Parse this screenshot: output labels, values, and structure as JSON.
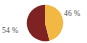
{
  "figure": {
    "background_color": "#ffffff",
    "label_color": "#4a4a4a"
  },
  "chart_data": {
    "type": "pie",
    "title": "",
    "subtitle": "",
    "xlabel": "",
    "ylabel": "",
    "grid": false,
    "legend_position": "none",
    "start_angle_deg": 0,
    "direction": "clockwise",
    "categories": [
      "46 %",
      "54 %"
    ],
    "values": [
      46,
      54
    ],
    "units": "percent",
    "total": 100,
    "slices": [
      {
        "label": "46 %",
        "value": 46,
        "color": "#f2b844",
        "position": "right",
        "label_placement": "outside-upper-right"
      },
      {
        "label": "54 %",
        "value": 54,
        "color": "#7e2222",
        "position": "left",
        "label_placement": "outside-left"
      }
    ],
    "annotations": [
      {
        "text": "46 %",
        "x": 64,
        "y": 10
      },
      {
        "text": "54 %",
        "x": 2,
        "y": 27
      }
    ]
  },
  "labels": {
    "right": "46 %",
    "left": "54 %"
  },
  "colors": {
    "slice_gold": "#f2b844",
    "slice_maroon": "#7e2222",
    "background": "#ffffff",
    "text": "#4a4a4a"
  }
}
